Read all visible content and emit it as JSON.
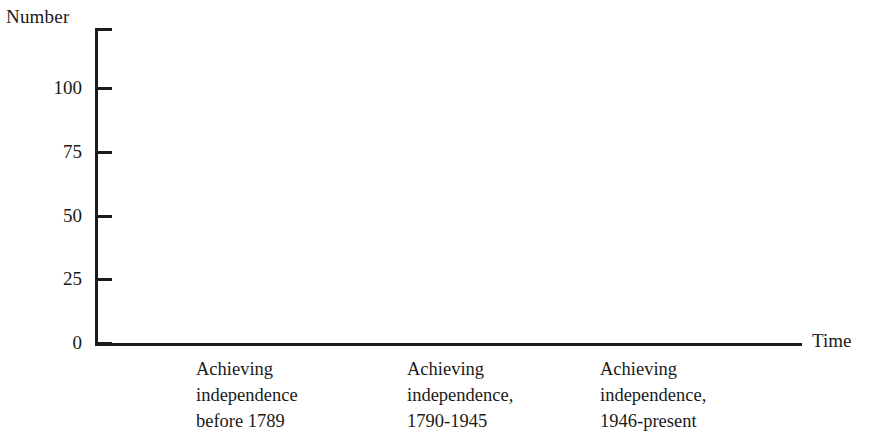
{
  "chart_data": {
    "type": "bar",
    "title": "",
    "subtitle": "",
    "xlabel": "Time",
    "ylabel": "Number",
    "categories": [
      "Achieving\nindependence\nbefore 1789",
      "Achieving\nindependence,\n1790-1945",
      "Achieving\nindependence,\n1946-present"
    ],
    "values": [
      23,
      49,
      96
    ],
    "value_labels": [
      "23",
      "49",
      "96"
    ],
    "ylim": [
      0,
      110
    ],
    "ytick_values": [
      0,
      25,
      50,
      75,
      100
    ],
    "ytick_labels": [
      "0",
      "25",
      "50",
      "75",
      "100"
    ],
    "grid": false,
    "legend": null,
    "series": [
      {
        "name": "Number of states",
        "values": [
          23,
          49,
          96
        ]
      }
    ],
    "colors": {
      "bar_fill": "#ffffff",
      "bar_outline": "#1b1b1b",
      "bar_shadow": "#b9b9b9",
      "axis": "#1b1b1b",
      "text": "#1a1a1a",
      "background": "#ffffff"
    }
  }
}
